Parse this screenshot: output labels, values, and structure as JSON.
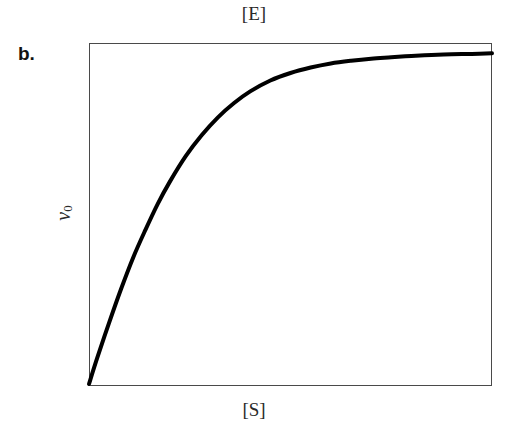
{
  "figure": {
    "panel_letter": "b.",
    "top_label": "[E]",
    "bottom_label": "[S]",
    "yaxis_label_main": "v",
    "yaxis_label_sub": "0",
    "background_color": "#ffffff",
    "curve_color": "#000000",
    "frame_color": "#4a4a4a"
  },
  "chart_data": {
    "type": "line",
    "title": "",
    "subtitle": "",
    "xlabel": "[S]",
    "ylabel": "v0",
    "top_annotation": "[E]",
    "panel": "b.",
    "grid": false,
    "legend": null,
    "axis_ticks": {
      "x": [],
      "y": []
    },
    "xlim": [
      0,
      1
    ],
    "ylim": [
      0,
      1
    ],
    "series": [
      {
        "name": "v0 vs [S]",
        "color": "#000000",
        "line_width": 4,
        "x": [
          0.0,
          0.02,
          0.05,
          0.08,
          0.11,
          0.14,
          0.17,
          0.2,
          0.24,
          0.28,
          0.32,
          0.36,
          0.4,
          0.45,
          0.5,
          0.55,
          0.6,
          0.65,
          0.7,
          0.75,
          0.8,
          0.85,
          0.9,
          0.95,
          1.0
        ],
        "y": [
          0.0,
          0.075,
          0.18,
          0.28,
          0.372,
          0.452,
          0.527,
          0.592,
          0.668,
          0.73,
          0.782,
          0.824,
          0.858,
          0.89,
          0.912,
          0.928,
          0.94,
          0.948,
          0.954,
          0.958,
          0.962,
          0.965,
          0.967,
          0.968,
          0.97
        ]
      }
    ],
    "plateau_value": 0.97,
    "origin_value": 0.0
  }
}
